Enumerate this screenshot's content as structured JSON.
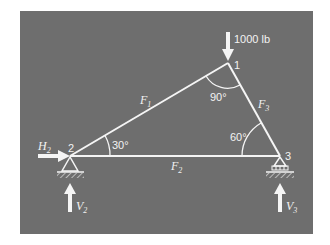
{
  "diagram": {
    "type": "truss-free-body",
    "background_color": "#6e6e6e",
    "line_color": "#f5f5f5",
    "load": {
      "label": "1000 lb",
      "direction": "down",
      "at_node": "1"
    },
    "nodes": [
      {
        "id": "1",
        "label": "1",
        "x": 228,
        "y": 63
      },
      {
        "id": "2",
        "label": "2",
        "x": 70,
        "y": 156,
        "support": "pin"
      },
      {
        "id": "3",
        "label": "3",
        "x": 280,
        "y": 156,
        "support": "roller"
      }
    ],
    "members": [
      {
        "name": "F",
        "sub": "1",
        "from": "2",
        "to": "1"
      },
      {
        "name": "F",
        "sub": "2",
        "from": "2",
        "to": "3"
      },
      {
        "name": "F",
        "sub": "3",
        "from": "1",
        "to": "3"
      }
    ],
    "angles": [
      {
        "label": "30°",
        "at_node": "2"
      },
      {
        "label": "90°",
        "at_node": "1"
      },
      {
        "label": "60°",
        "at_node": "3"
      }
    ],
    "reactions": [
      {
        "name": "H",
        "sub": "2",
        "direction": "right",
        "at_node": "2"
      },
      {
        "name": "V",
        "sub": "2",
        "direction": "up",
        "at_node": "2"
      },
      {
        "name": "V",
        "sub": "3",
        "direction": "up",
        "at_node": "3"
      }
    ]
  }
}
